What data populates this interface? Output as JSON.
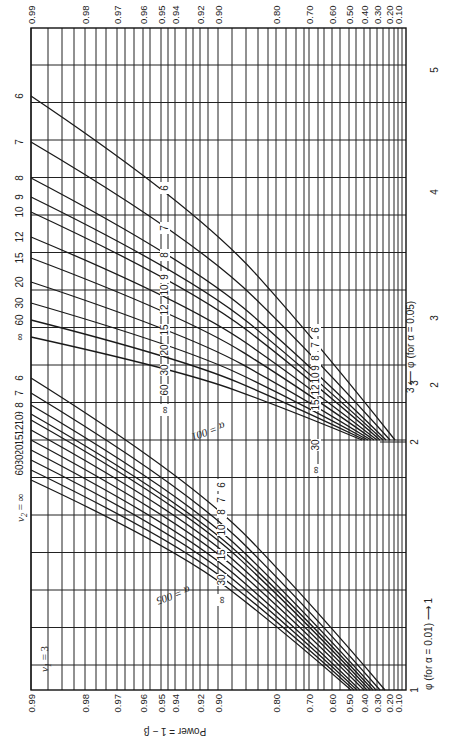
{
  "chart_data": {
    "type": "line",
    "orientation": "rotated 90° counter-clockwise",
    "nu1_label": "ν1 = 3",
    "nu2_label": "ν2 = ∞",
    "ylabel": "Power = 1 − β",
    "xlabel_alpha_001": "φ (for α = 0.01) ⟶",
    "xlabel_alpha_005": "⟵ φ (for α = 0.05)",
    "power_ticks": [
      "0.99",
      "0.98",
      "0.97",
      "0.96",
      "0.95",
      "0.94",
      "0.92",
      "0.90",
      "0.80",
      "0.70",
      "0.60",
      "0.50",
      "0.40",
      "0.30",
      "0.20",
      "0.10"
    ],
    "phi_ticks_alpha_001": [
      "1",
      "2",
      "3"
    ],
    "phi_ticks_alpha_005": [
      "1",
      "2",
      "3",
      "4",
      "5"
    ],
    "series_groups": [
      {
        "name": "α = 0.05",
        "label": "α = 005",
        "nu2_values": [
          "6",
          "7",
          "8",
          "9",
          "10",
          "12",
          "15",
          "20",
          "30",
          "60",
          "∞"
        ],
        "phi_range": [
          1,
          3
        ],
        "power_range": [
          0.25,
          0.99
        ]
      },
      {
        "name": "α = 0.01",
        "label": "α = 001",
        "nu2_values": [
          "6",
          "7",
          "8",
          "9",
          "10",
          "12",
          "15",
          "20",
          "30",
          "60",
          "∞"
        ],
        "phi_range": [
          2,
          5
        ],
        "power_range": [
          0.15,
          0.99
        ]
      }
    ],
    "series": [
      {
        "name": "α=0.05, ν2=6",
        "phi_at_power_099": 3.0,
        "phi_at_power_050": 1.7
      },
      {
        "name": "α=0.05, ν2=7",
        "phi_at_power_099": 2.85,
        "phi_at_power_050": 1.65
      },
      {
        "name": "α=0.05, ν2=8",
        "phi_at_power_099": 2.75,
        "phi_at_power_050": 1.62
      },
      {
        "name": "α=0.05, ν2=9",
        "phi_at_power_099": 2.68,
        "phi_at_power_050": 1.6
      },
      {
        "name": "α=0.05, ν2=10",
        "phi_at_power_099": 2.63,
        "phi_at_power_050": 1.58
      },
      {
        "name": "α=0.05, ν2=12",
        "phi_at_power_099": 2.55,
        "phi_at_power_050": 1.55
      },
      {
        "name": "α=0.05, ν2=15",
        "phi_at_power_099": 2.48,
        "phi_at_power_050": 1.52
      },
      {
        "name": "α=0.05, ν2=20",
        "phi_at_power_099": 2.42,
        "phi_at_power_050": 1.49
      },
      {
        "name": "α=0.05, ν2=30",
        "phi_at_power_099": 2.36,
        "phi_at_power_050": 1.46
      },
      {
        "name": "α=0.05, ν2=60",
        "phi_at_power_099": 2.3,
        "phi_at_power_050": 1.43
      },
      {
        "name": "α=0.05, ν2=∞",
        "phi_at_power_099": 2.25,
        "phi_at_power_050": 1.4
      },
      {
        "name": "α=0.01, ν2=6",
        "phi_at_power_099": 5.0,
        "phi_at_power_050": 2.9
      },
      {
        "name": "α=0.01, ν2=7",
        "phi_at_power_099": 4.55,
        "phi_at_power_050": 2.75
      },
      {
        "name": "α=0.01, ν2=8",
        "phi_at_power_099": 4.25,
        "phi_at_power_050": 2.63
      },
      {
        "name": "α=0.01, ν2=9",
        "phi_at_power_099": 4.05,
        "phi_at_power_050": 2.55
      },
      {
        "name": "α=0.01, ν2=10",
        "phi_at_power_099": 3.9,
        "phi_at_power_050": 2.48
      },
      {
        "name": "α=0.01, ν2=12",
        "phi_at_power_099": 3.7,
        "phi_at_power_050": 2.4
      },
      {
        "name": "α=0.01, ν2=15",
        "phi_at_power_099": 3.5,
        "phi_at_power_050": 2.32
      },
      {
        "name": "α=0.01, ν2=20",
        "phi_at_power_099": 3.33,
        "phi_at_power_050": 2.25
      },
      {
        "name": "α=0.01, ν2=30",
        "phi_at_power_099": 3.18,
        "phi_at_power_050": 2.18
      },
      {
        "name": "α=0.01, ν2=60",
        "phi_at_power_099": 3.03,
        "phi_at_power_050": 2.11
      },
      {
        "name": "α=0.01, ν2=∞",
        "phi_at_power_099": 2.93,
        "phi_at_power_050": 2.05
      }
    ],
    "grid": true,
    "legend": "inline curve labels"
  },
  "labels": {
    "nu1": "ν",
    "nu1_sub": "1",
    "nu1_eq": " = 3",
    "nu2": "ν",
    "nu2_sub": "2",
    "nu2_eq": " = ∞",
    "power_axis": "Power = 1 − β",
    "phi_001": "φ (for  α = 0.01)  ⟶  1",
    "phi_005": "3  ⟵  φ (for α = 0.05)",
    "alpha_005": "α = 005",
    "alpha_001": "α = 001"
  }
}
